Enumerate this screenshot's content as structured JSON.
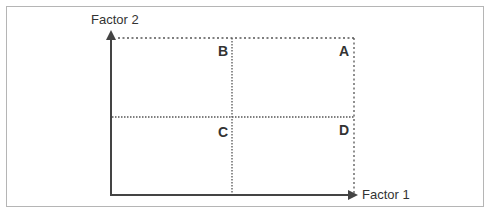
{
  "diagram": {
    "axes": {
      "y_label": "Factor 2",
      "x_label": "Factor 1"
    },
    "quadrants": [
      {
        "id": "B",
        "label": "B",
        "position": "top-left"
      },
      {
        "id": "A",
        "label": "A",
        "position": "top-right"
      },
      {
        "id": "C",
        "label": "C",
        "position": "bottom-left"
      },
      {
        "id": "D",
        "label": "D",
        "position": "bottom-right"
      }
    ],
    "colors": {
      "axis": "#444444",
      "dotted": "#555555",
      "text": "#333333",
      "border": "#b5b5b5"
    }
  }
}
